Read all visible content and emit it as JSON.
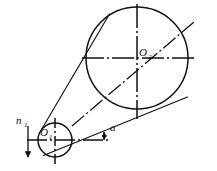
{
  "diagram": {
    "background": "#ffffff",
    "stroke_color": "#111111",
    "labels": {
      "small_pulley_center": "O",
      "small_pulley_center_sub": "1",
      "large_pulley_center": "O",
      "large_pulley_center_sub": "2",
      "rotation_speed": "n",
      "rotation_speed_sub": "1",
      "angle": "a"
    },
    "geometry": {
      "small_pulley": {
        "cx": 55,
        "cy": 140,
        "r": 17
      },
      "large_pulley": {
        "cx": 137,
        "cy": 58,
        "r": 51
      },
      "center_distance_line": {
        "x1": 55,
        "y1": 140,
        "x2": 193,
        "y2": 23
      },
      "small_horizontal_centerline": {
        "x1": 27,
        "y1": 140,
        "x2": 110,
        "y2": 140
      },
      "small_vertical_centerline": {
        "x1": 55,
        "y1": 117,
        "x2": 55,
        "y2": 165
      },
      "large_horizontal_centerline": {
        "x1": 80,
        "y1": 58,
        "x2": 197,
        "y2": 58
      },
      "large_vertical_centerline": {
        "x1": 137,
        "y1": 4,
        "x2": 137,
        "y2": 119
      },
      "belt_upper_tangent": {
        "x1": 42,
        "y1": 128,
        "x2": 105,
        "y2": 20
      },
      "belt_lower_tangent": {
        "x1": 44,
        "y1": 156,
        "x2": 185,
        "y2": 99
      },
      "rotation_arrow": {
        "x": 28,
        "y1": 126,
        "y2": 157
      },
      "angle_arc": {
        "cx": 55,
        "cy": 140,
        "r": 49,
        "from_deg": 0,
        "to_deg": 40
      }
    }
  }
}
